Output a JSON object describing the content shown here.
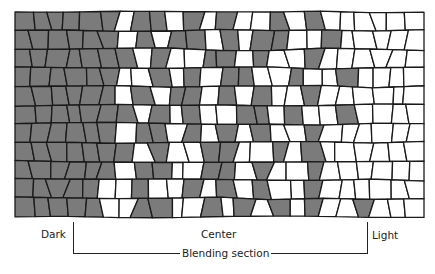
{
  "diagram": {
    "type": "tile-mosaic-blend",
    "colors": {
      "dark": "#7b7b7b",
      "light": "#ffffff",
      "grout": "#1a1a1a"
    },
    "area": {
      "left": 15,
      "top": 12,
      "right": 424,
      "bottom": 217
    },
    "rows": [
      "DDDDDDLDDLDLDLLDLDLLLLLL",
      "DDDDDDLDLDDLDLDDLLDLLLLL",
      "DDDDDDDLDLLDDLDLLDLLLLLL",
      "DDDDDDLLDLDLDDLLDLLDLLLL",
      "DDDDDDLDLDDLDLDLLDLLLLLL",
      "DDDDDDDLDLDLLDDLDLLDLLLL",
      "DDDDDDLDDLDLDLDLLDLLLLLL",
      "DDDDDDDLDLLDDLLDLDLLLLLL",
      "DDDDDDLDDLLDDLDLLDLLLLLL",
      "DDDDDLLDLLDLDLDLLDLLLLLL",
      "DDDDDLLDDLLDLDLDLDLLDLLL"
    ]
  },
  "labels": {
    "dark": "Dark",
    "center": "Center",
    "light": "Light",
    "blending_section": "Blending section"
  },
  "bracket": {
    "left_x": 73,
    "right_x": 367,
    "top_y": 222,
    "bottom_y": 253
  }
}
